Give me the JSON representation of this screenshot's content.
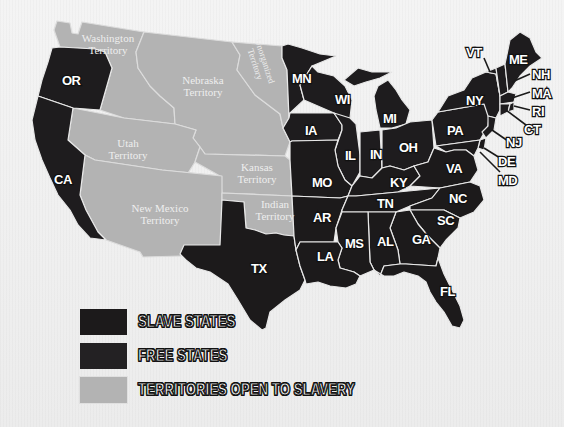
{
  "map": {
    "colors": {
      "slave_states": "#1c1a1b",
      "free_states": "#1e1c1e",
      "territories": "#b3b3b3",
      "background": "#f1f1f1",
      "borders": "#e8e8e8"
    },
    "territories": [
      {
        "id": "washington",
        "line1": "Washington",
        "line2": "Territory"
      },
      {
        "id": "nebraska",
        "line1": "Nebraska",
        "line2": "Territory"
      },
      {
        "id": "unorganized",
        "line1": "Unorganized",
        "line2": "Territory"
      },
      {
        "id": "utah",
        "line1": "Utah",
        "line2": "Territory"
      },
      {
        "id": "kansas",
        "line1": "Kansas",
        "line2": "Territory"
      },
      {
        "id": "new_mexico",
        "line1": "New Mexico",
        "line2": "Territory"
      },
      {
        "id": "indian",
        "line1": "Indian",
        "line2": "Territory"
      }
    ],
    "free_states": [
      "OR",
      "CA",
      "MN",
      "IA",
      "WI",
      "IL",
      "MI",
      "IN",
      "OH",
      "PA",
      "NY",
      "NJ",
      "VT",
      "NH",
      "ME",
      "MA",
      "RI",
      "CT"
    ],
    "slave_states": [
      "MO",
      "AR",
      "LA",
      "TX",
      "KY",
      "TN",
      "MS",
      "AL",
      "GA",
      "FL",
      "SC",
      "NC",
      "VA",
      "MD",
      "DE"
    ],
    "labels": {
      "OR": "OR",
      "CA": "CA",
      "MN": "MN",
      "WI": "WI",
      "IA": "IA",
      "IL": "IL",
      "MI": "MI",
      "IN": "IN",
      "OH": "OH",
      "PA": "PA",
      "NY": "NY",
      "VT": "VT",
      "ME": "ME",
      "NH": "NH",
      "MA": "MA",
      "RI": "RI",
      "CT": "CT",
      "NJ": "NJ",
      "DE": "DE",
      "MD": "MD",
      "MO": "MO",
      "KY": "KY",
      "VA": "VA",
      "AR": "AR",
      "TN": "TN",
      "NC": "NC",
      "SC": "SC",
      "MS": "MS",
      "AL": "AL",
      "GA": "GA",
      "LA": "LA",
      "TX": "TX",
      "FL": "FL"
    }
  },
  "legend": {
    "items": [
      {
        "label": "SLAVE STATES",
        "color": "#1c1a1b"
      },
      {
        "label": "FREE STATES",
        "color": "#232123"
      },
      {
        "label": "TERRITORIES OPEN TO SLAVERY",
        "color": "#b3b3b3"
      }
    ]
  }
}
